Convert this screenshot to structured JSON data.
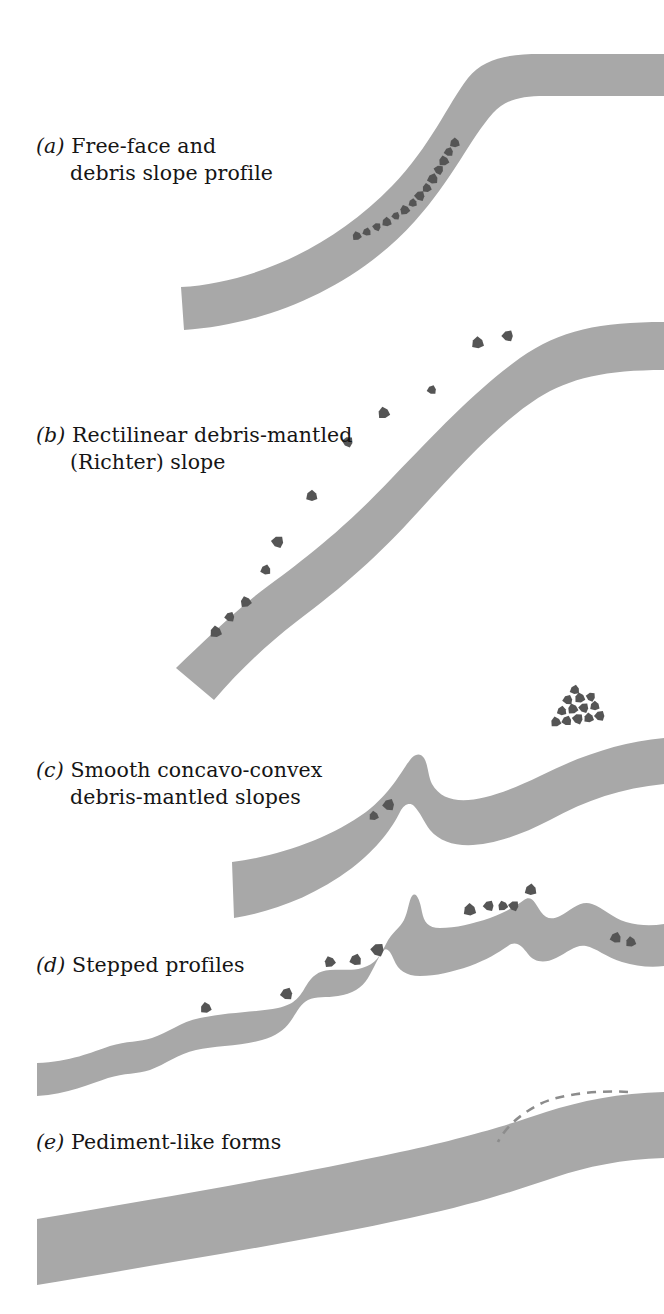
{
  "figure": {
    "background_color": "#ffffff",
    "band_fill_color": "#a8a8a8",
    "rock_fill_color": "#555555",
    "dashed_line_color": "#8c8c8c",
    "text_color": "#151515"
  },
  "captions": [
    {
      "id": "a",
      "tag": "(a)",
      "line1": "Free-face and",
      "line2": "debris slope profile"
    },
    {
      "id": "b",
      "tag": "(b)",
      "line1": "Rectilinear debris-mantled",
      "line2": "(Richter) slope"
    },
    {
      "id": "c",
      "tag": "(c)",
      "line1": "Smooth concavo-convex",
      "line2": "debris-mantled slopes"
    },
    {
      "id": "d",
      "tag": "(d)",
      "line1": "Stepped profiles",
      "line2": ""
    },
    {
      "id": "e",
      "tag": "(e)",
      "line1": "Pediment-like forms",
      "line2": ""
    }
  ],
  "chart_data": {
    "type": "diagram",
    "panels": [
      {
        "id": "a",
        "label": "Free-face and debris slope profile",
        "band_path": "M181,287 C 250,283 330,250 392,186 C 430,147 448,104 468,78 C 484,58 510,54 540,54 L 664,54 L 664,96 L 545,96 C 520,96 505,100 493,113 C 470,139 452,180 415,221 C 352,291 262,325 184,330 Z",
        "debris_count": 14,
        "debris": [
          {
            "x": 357,
            "y": 236,
            "r": 5.0,
            "rot": 12
          },
          {
            "x": 367,
            "y": 232,
            "r": 4.6,
            "rot": 40
          },
          {
            "x": 377,
            "y": 227,
            "r": 4.6,
            "rot": 70
          },
          {
            "x": 387,
            "y": 222,
            "r": 5.2,
            "rot": 25
          },
          {
            "x": 396,
            "y": 216,
            "r": 4.4,
            "rot": 55
          },
          {
            "x": 405,
            "y": 210,
            "r": 5.4,
            "rot": 8
          },
          {
            "x": 413,
            "y": 203,
            "r": 4.6,
            "rot": 33
          },
          {
            "x": 420,
            "y": 196,
            "r": 5.6,
            "rot": 62
          },
          {
            "x": 427,
            "y": 188,
            "r": 5.0,
            "rot": 18
          },
          {
            "x": 433,
            "y": 179,
            "r": 5.8,
            "rot": 45
          },
          {
            "x": 439,
            "y": 170,
            "r": 5.2,
            "rot": 75
          },
          {
            "x": 444,
            "y": 161,
            "r": 5.6,
            "rot": 15
          },
          {
            "x": 449,
            "y": 152,
            "r": 5.0,
            "rot": 50
          },
          {
            "x": 455,
            "y": 143,
            "r": 5.4,
            "rot": 28
          }
        ]
      },
      {
        "id": "b",
        "label": "Rectilinear debris-mantled (Richter) slope",
        "band_path": "M176,668 C 205,640 238,608 268,586 C 320,548 352,520 392,478 C 440,428 478,388 520,358 C 560,330 600,322 664,322 L 664,370 C 606,370 570,378 538,398 C 498,424 462,464 418,512 C 378,556 344,586 296,622 C 266,645 238,672 214,700 Z",
        "debris_count": 11,
        "debris": [
          {
            "x": 216,
            "y": 632,
            "r": 6.4,
            "rot": 20
          },
          {
            "x": 230,
            "y": 617,
            "r": 5.4,
            "rot": 55
          },
          {
            "x": 246,
            "y": 602,
            "r": 6.0,
            "rot": 10
          },
          {
            "x": 266,
            "y": 570,
            "r": 5.6,
            "rot": 42
          },
          {
            "x": 278,
            "y": 542,
            "r": 6.6,
            "rot": 68
          },
          {
            "x": 312,
            "y": 496,
            "r": 6.2,
            "rot": 30
          },
          {
            "x": 348,
            "y": 442,
            "r": 5.8,
            "rot": 72
          },
          {
            "x": 384,
            "y": 413,
            "r": 6.4,
            "rot": 15
          },
          {
            "x": 432,
            "y": 390,
            "r": 5.0,
            "rot": 48
          },
          {
            "x": 478,
            "y": 343,
            "r": 6.6,
            "rot": 25
          },
          {
            "x": 508,
            "y": 336,
            "r": 6.2,
            "rot": 60
          }
        ]
      },
      {
        "id": "c",
        "label": "Smooth concavo-convex debris-mantled slopes",
        "band_path": "M232,862 C 280,856 330,838 366,812 C 392,792 402,770 410,760 C 414,754 420,752 424,758 C 428,764 428,776 432,784 C 448,812 490,800 540,776 C 580,756 620,742 664,738 L 664,784 C 622,788 586,800 550,820 C 500,846 452,856 430,830 C 424,822 420,812 414,806 C 410,802 404,804 400,812 C 392,828 378,848 352,868 C 312,898 270,912 234,918 Z",
        "debris_count": 15,
        "debris": [
          {
            "x": 374,
            "y": 816,
            "r": 5.2,
            "rot": 20
          },
          {
            "x": 389,
            "y": 805,
            "r": 6.4,
            "rot": 55
          },
          {
            "x": 556,
            "y": 722,
            "r": 5.6,
            "rot": 15
          },
          {
            "x": 567,
            "y": 721,
            "r": 5.4,
            "rot": 48
          },
          {
            "x": 578,
            "y": 719,
            "r": 5.8,
            "rot": 70
          },
          {
            "x": 589,
            "y": 718,
            "r": 5.4,
            "rot": 22
          },
          {
            "x": 600,
            "y": 716,
            "r": 5.6,
            "rot": 60
          },
          {
            "x": 562,
            "y": 711,
            "r": 5.2,
            "rot": 35
          },
          {
            "x": 573,
            "y": 709,
            "r": 5.6,
            "rot": 12
          },
          {
            "x": 584,
            "y": 708,
            "r": 5.4,
            "rot": 66
          },
          {
            "x": 595,
            "y": 706,
            "r": 5.2,
            "rot": 28
          },
          {
            "x": 568,
            "y": 700,
            "r": 5.4,
            "rot": 52
          },
          {
            "x": 580,
            "y": 698,
            "r": 5.6,
            "rot": 18
          },
          {
            "x": 591,
            "y": 697,
            "r": 5.0,
            "rot": 74
          },
          {
            "x": 575,
            "y": 690,
            "r": 5.2,
            "rot": 40
          }
        ]
      },
      {
        "id": "d",
        "label": "Stepped profiles",
        "band_path": "M37,1063 C 70,1062 92,1052 110,1046 C 126,1041 140,1042 152,1038 C 168,1033 180,1022 200,1018 C 228,1012 258,1012 278,1008 C 296,1004 300,996 306,986 C 312,976 318,971 330,970 C 344,969 352,971 362,968 C 376,964 380,956 386,944 C 392,932 400,928 404,920 C 408,912 409,900 412,896 C 416,891 420,900 422,912 C 424,922 428,928 440,928 C 456,928 472,924 490,918 C 506,912 516,906 524,900 C 532,894 536,905 541,912 C 546,919 552,920 560,916 C 572,910 580,900 592,904 C 604,908 612,918 626,922 C 640,926 652,926 664,924 L 664,966 C 650,968 636,966 622,962 C 606,957 596,948 586,946 C 576,944 568,952 556,958 C 544,964 534,962 528,954 C 522,946 516,940 508,946 C 498,953 486,960 470,966 C 452,972 436,976 420,976 C 406,976 398,970 394,960 C 390,950 386,946 382,952 C 378,958 374,968 368,978 C 362,988 352,994 338,996 C 326,998 316,996 308,1000 C 300,1004 296,1014 290,1022 C 284,1030 276,1036 262,1040 C 242,1046 214,1046 196,1050 C 178,1054 166,1064 150,1070 C 138,1074 124,1073 108,1078 C 90,1084 68,1094 37,1096 Z",
        "debris_count": 11,
        "debris": [
          {
            "x": 206,
            "y": 1008,
            "r": 6.0,
            "rot": 18
          },
          {
            "x": 287,
            "y": 994,
            "r": 6.6,
            "rot": 52
          },
          {
            "x": 330,
            "y": 962,
            "r": 6.0,
            "rot": 8
          },
          {
            "x": 356,
            "y": 960,
            "r": 6.4,
            "rot": 44
          },
          {
            "x": 378,
            "y": 950,
            "r": 7.2,
            "rot": 66
          },
          {
            "x": 470,
            "y": 910,
            "r": 6.8,
            "rot": 26
          },
          {
            "x": 489,
            "y": 906,
            "r": 5.8,
            "rot": 58
          },
          {
            "x": 503,
            "y": 906,
            "r": 5.4,
            "rot": 12
          },
          {
            "x": 514,
            "y": 906,
            "r": 5.6,
            "rot": 70
          },
          {
            "x": 531,
            "y": 890,
            "r": 6.4,
            "rot": 34
          },
          {
            "x": 616,
            "y": 938,
            "r": 6.0,
            "rot": 46
          },
          {
            "x": 631,
            "y": 942,
            "r": 5.6,
            "rot": 20
          }
        ]
      },
      {
        "id": "e",
        "label": "Pediment-like forms",
        "band_path": "M37,1219 C 150,1200 290,1176 400,1152 C 470,1137 510,1124 546,1112 C 580,1101 620,1093 664,1092 L 664,1158 C 622,1159 586,1167 556,1177 C 520,1189 480,1203 410,1218 C 300,1242 150,1266 37,1285 Z",
        "dashed_path": "M628,1092 C 600,1090 560,1094 540,1104 C 520,1114 505,1128 498,1142",
        "debris_count": 0,
        "debris": []
      }
    ]
  }
}
